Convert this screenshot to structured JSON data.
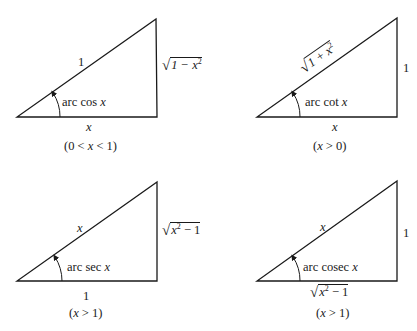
{
  "diagram": {
    "type": "inverse-trig-right-triangles",
    "stroke_color": "#1a1a1a",
    "background": "#ffffff",
    "panels": [
      {
        "id": "arccos",
        "angle_label": "arc cos x",
        "angle_func": "arc cos",
        "angle_var": "x",
        "hypotenuse": "1",
        "opposite": {
          "radicand": "1 − x",
          "exp": "2"
        },
        "adjacent": "x",
        "condition": "(0 < x < 1)",
        "cond_parts": [
          "(0 < ",
          "x",
          " < 1)"
        ]
      },
      {
        "id": "arccot",
        "angle_label": "arc cot x",
        "angle_func": "arc cot",
        "angle_var": "x",
        "hypotenuse": {
          "radicand": "1 + x",
          "exp": "2"
        },
        "opposite": "1",
        "adjacent": "x",
        "condition": "(x > 0)",
        "cond_parts": [
          "(",
          "x",
          " > 0)"
        ]
      },
      {
        "id": "arcsec",
        "angle_label": "arc sec x",
        "angle_func": "arc sec",
        "angle_var": "x",
        "hypotenuse": "x",
        "opposite": {
          "radicand": "x",
          "exp": "2",
          "rest": " − 1"
        },
        "adjacent": "1",
        "condition": "(x > 1)",
        "cond_parts": [
          "(",
          "x",
          " > 1)"
        ]
      },
      {
        "id": "arccosec",
        "angle_label": "arc cosec x",
        "angle_func": "arc cosec",
        "angle_var": "x",
        "hypotenuse": "x",
        "opposite": "1",
        "adjacent": {
          "radicand": "x",
          "exp": "2",
          "rest": " − 1"
        },
        "condition": "(x > 1)",
        "cond_parts": [
          "(",
          "x",
          " > 1)"
        ]
      }
    ]
  }
}
